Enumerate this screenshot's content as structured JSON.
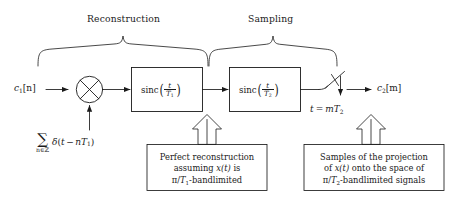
{
  "diagram": {
    "title_braces": [
      {
        "id": "reconstruction",
        "label": "Reconstruction"
      },
      {
        "id": "sampling",
        "label": "Sampling"
      }
    ],
    "signals": {
      "input_label": "c₁[n]",
      "input_base": "c",
      "input_sub": "1",
      "input_index": "[n]",
      "output_label": "c₂[m]",
      "output_base": "c",
      "output_sub": "2",
      "output_index": "[m]"
    },
    "blocks": [
      {
        "id": "sinc-t-over-T1",
        "function": "sinc",
        "numerator": "t",
        "denominator_base": "T",
        "denominator_sub": "1",
        "label": "sinc(t/T₁)"
      },
      {
        "id": "sinc-t-over-T2",
        "function": "sinc",
        "numerator": "t",
        "denominator_base": "T",
        "denominator_sub": "2",
        "label": "sinc(t/T₂)"
      }
    ],
    "multiplier": {
      "id": "multiplier",
      "symbol": "⊗",
      "description": "circle-with-cross multiplier"
    },
    "impulse_train": {
      "sigma": "∑",
      "sigma_subscript": "n∈ℤ",
      "expression": "δ(t − nT₁)",
      "delta": "δ",
      "open": "(",
      "arg_t": "t",
      "minus": "−",
      "arg_n": "n",
      "arg_T": "T",
      "arg_T_sub": "1",
      "close": ")",
      "full_label": "∑ n∈ℤ δ(t − nT₁)"
    },
    "sampler": {
      "id": "sampler-switch",
      "label_prefix": "t",
      "label_equals": "=",
      "label_m": "m",
      "label_T": "T",
      "label_T_sub": "2",
      "full_label": "t = mT₂"
    },
    "captions": [
      {
        "id": "caption-perfect-reconstruction",
        "line1": "Perfect reconstruction",
        "line2_pre": "assuming ",
        "line2_math": "x(t)",
        "line2_post": " is",
        "line3_pi": "π",
        "line3_slash": "/",
        "line3_T": "T",
        "line3_T_sub": "1",
        "line3_post": "-bandlimited",
        "full_text": "Perfect reconstruction assuming x(t) is π/T₁-bandlimited"
      },
      {
        "id": "caption-samples-projection",
        "line1": "Samples of the projection",
        "line2_pre": "of ",
        "line2_math": "x(t)",
        "line2_post": " onto the space of",
        "line3_pi": "π",
        "line3_slash": "/",
        "line3_T": "T",
        "line3_T_sub": "2",
        "line3_post": "-bandlimited signals",
        "full_text": "Samples of the projection of x(t) onto the space of π/T₂-bandlimited signals"
      }
    ],
    "colors": {
      "stroke": "#1a1a1a",
      "background": "#ffffff",
      "text": "#1a1a1a"
    }
  }
}
